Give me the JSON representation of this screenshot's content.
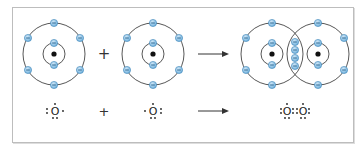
{
  "figure": {
    "colors": {
      "electron_fill": "#8ec3e6",
      "electron_stroke": "#3f87b8",
      "electron_mark": "#1f5f8a",
      "shell_stroke": "#444444",
      "nucleus": "#111111",
      "frame": "#bdbdbd"
    },
    "top_row": {
      "atom_left": {
        "label": "O",
        "inner_electrons": 2,
        "outer_electrons": 6
      },
      "plus": "+",
      "atom_right": {
        "label": "O",
        "inner_electrons": 2,
        "outer_electrons": 6
      },
      "arrow": "→",
      "product": {
        "label": "O2",
        "shared_electrons": 4
      }
    },
    "bottom_row": {
      "reactant_left": "O",
      "plus": "+",
      "reactant_right": "O",
      "product_left": "O",
      "product_right": "O"
    }
  }
}
